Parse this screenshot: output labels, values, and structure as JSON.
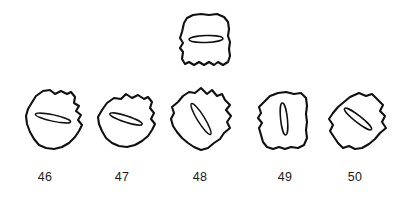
{
  "plate": {
    "background_color": "#ffffff",
    "ink_color": "#101010",
    "label_color": "#1a1a1a",
    "figure_count": 6
  },
  "figures": [
    {
      "id": "specimen-top",
      "label": "",
      "numbered": false,
      "row": "top",
      "outline_shape": "rounded-square-scalloped-base",
      "aperture_orientation": "horizontal",
      "aperture_angle_deg": 0,
      "bbox": {
        "x": 177,
        "y": 13,
        "w": 56,
        "h": 56
      }
    },
    {
      "id": "specimen-46",
      "label": "46",
      "numbered": true,
      "row": "bottom",
      "outline_shape": "irregular-rounded-polygon",
      "aperture_orientation": "near-horizontal",
      "aperture_angle_deg": 12,
      "bbox": {
        "x": 22,
        "y": 87,
        "w": 62,
        "h": 62
      }
    },
    {
      "id": "specimen-47",
      "label": "47",
      "numbered": true,
      "row": "bottom",
      "outline_shape": "irregular-rounded-polygon",
      "aperture_orientation": "near-horizontal",
      "aperture_angle_deg": 18,
      "bbox": {
        "x": 95,
        "y": 91,
        "w": 62,
        "h": 58
      }
    },
    {
      "id": "specimen-48",
      "label": "48",
      "numbered": true,
      "row": "bottom",
      "outline_shape": "diamond-rounded",
      "aperture_orientation": "diagonal",
      "aperture_angle_deg": 58,
      "bbox": {
        "x": 168,
        "y": 86,
        "w": 64,
        "h": 64
      }
    },
    {
      "id": "specimen-49",
      "label": "49",
      "numbered": true,
      "row": "bottom",
      "outline_shape": "rounded-rectangle-wavy",
      "aperture_orientation": "vertical",
      "aperture_angle_deg": 84,
      "bbox": {
        "x": 256,
        "y": 90,
        "w": 56,
        "h": 60
      }
    },
    {
      "id": "specimen-50",
      "label": "50",
      "numbered": true,
      "row": "bottom",
      "outline_shape": "diamond-rounded",
      "aperture_orientation": "diagonal",
      "aperture_angle_deg": 38,
      "bbox": {
        "x": 326,
        "y": 90,
        "w": 62,
        "h": 60
      }
    }
  ],
  "labels": [
    {
      "text": "46",
      "x": 45,
      "y": 170
    },
    {
      "text": "47",
      "x": 122,
      "y": 170
    },
    {
      "text": "48",
      "x": 200,
      "y": 170
    },
    {
      "text": "49",
      "x": 285,
      "y": 170
    },
    {
      "text": "50",
      "x": 355,
      "y": 170
    }
  ]
}
